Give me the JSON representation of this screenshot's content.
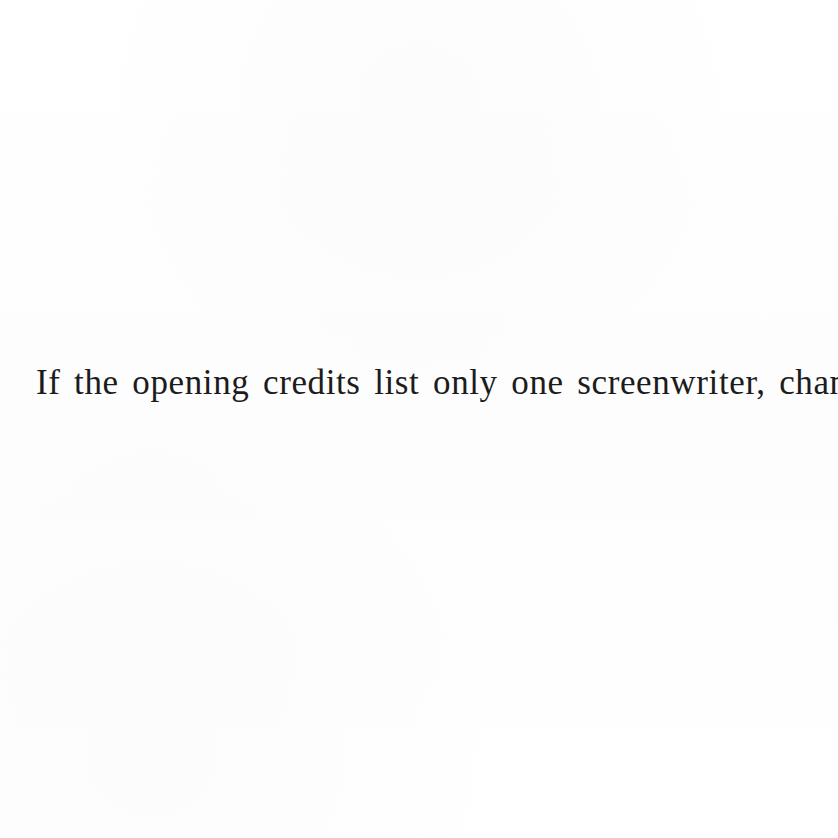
{
  "page": {
    "kind": "scanned-book-page-fragment",
    "background_color": "#ffffff",
    "text_color": "#1c1c1c"
  },
  "content": {
    "lines": [
      {
        "text": "If the opening credits list only one screenwriter, chances"
      }
    ],
    "full_text": "If the opening credits list only one screenwriter, chances"
  }
}
